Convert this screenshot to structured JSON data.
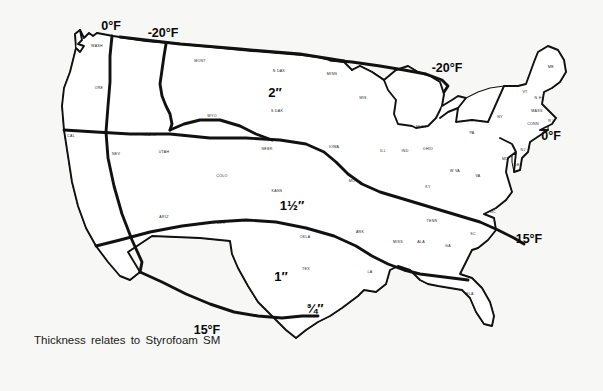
{
  "figure": {
    "caption": "Thickness relates to Styrofoam SM",
    "background_color": "#f7f7f5",
    "line_color": "#111111"
  },
  "temperature_labels": [
    {
      "id": "temp-0f-northwest",
      "text": "0°F",
      "x": 111,
      "y": 30
    },
    {
      "id": "temp-minus20f-west",
      "text": "-20°F",
      "x": 163,
      "y": 37
    },
    {
      "id": "temp-minus20f-lakes",
      "text": "-20°F",
      "x": 447,
      "y": 72
    },
    {
      "id": "temp-0f-northeast",
      "text": "0°F",
      "x": 551,
      "y": 140
    },
    {
      "id": "temp-15f-southeast",
      "text": "15°F",
      "x": 529,
      "y": 243
    },
    {
      "id": "temp-15f-texas",
      "text": "15°F",
      "x": 207,
      "y": 334
    }
  ],
  "thickness_labels": [
    {
      "id": "thickness-2in",
      "text": "2″",
      "x": 275,
      "y": 97,
      "region": "N DAK"
    },
    {
      "id": "thickness-1-5in",
      "text": "1½″",
      "x": 292,
      "y": 210,
      "region": "KANS"
    },
    {
      "id": "thickness-1in",
      "text": "1″",
      "x": 281,
      "y": 281,
      "region": "TEX"
    },
    {
      "id": "thickness-0-75in",
      "text": "¾″",
      "x": 315,
      "y": 313,
      "region": "S TEX"
    }
  ],
  "state_labels": [
    {
      "abbr": "WASH",
      "x": 97,
      "y": 47
    },
    {
      "abbr": "ORE",
      "x": 99,
      "y": 89
    },
    {
      "abbr": "CAL",
      "x": 71,
      "y": 137
    },
    {
      "abbr": "NEV",
      "x": 116,
      "y": 155
    },
    {
      "abbr": "IDAHO",
      "x": 150,
      "y": 136
    },
    {
      "abbr": "UTAH",
      "x": 164,
      "y": 153
    },
    {
      "abbr": "ARIZ",
      "x": 164,
      "y": 218
    },
    {
      "abbr": "MONT",
      "x": 200,
      "y": 62
    },
    {
      "abbr": "WYO",
      "x": 212,
      "y": 117
    },
    {
      "abbr": "COLO",
      "x": 222,
      "y": 177
    },
    {
      "abbr": "N MEX",
      "x": 219,
      "y": 224
    },
    {
      "abbr": "N DAK",
      "x": 279,
      "y": 72
    },
    {
      "abbr": "S DAK",
      "x": 277,
      "y": 112
    },
    {
      "abbr": "NEBR",
      "x": 267,
      "y": 150
    },
    {
      "abbr": "KANS",
      "x": 277,
      "y": 192
    },
    {
      "abbr": "OKLA",
      "x": 305,
      "y": 238
    },
    {
      "abbr": "TEX",
      "x": 306,
      "y": 270
    },
    {
      "abbr": "MINN",
      "x": 332,
      "y": 75
    },
    {
      "abbr": "IOWA",
      "x": 334,
      "y": 148
    },
    {
      "abbr": "MO",
      "x": 352,
      "y": 182
    },
    {
      "abbr": "ARK",
      "x": 360,
      "y": 233
    },
    {
      "abbr": "LA",
      "x": 370,
      "y": 273
    },
    {
      "abbr": "WIS",
      "x": 363,
      "y": 99
    },
    {
      "abbr": "ILL",
      "x": 383,
      "y": 152
    },
    {
      "abbr": "MISS",
      "x": 398,
      "y": 243
    },
    {
      "abbr": "IND",
      "x": 405,
      "y": 152
    },
    {
      "abbr": "MICH",
      "x": 421,
      "y": 128
    },
    {
      "abbr": "OHIO",
      "x": 428,
      "y": 150
    },
    {
      "abbr": "KY",
      "x": 428,
      "y": 188
    },
    {
      "abbr": "ALA",
      "x": 421,
      "y": 243
    },
    {
      "abbr": "TENN",
      "x": 432,
      "y": 222
    },
    {
      "abbr": "GA",
      "x": 448,
      "y": 247
    },
    {
      "abbr": "FLA",
      "x": 470,
      "y": 295
    },
    {
      "abbr": "W VA",
      "x": 455,
      "y": 172
    },
    {
      "abbr": "PA",
      "x": 472,
      "y": 134
    },
    {
      "abbr": "VA",
      "x": 478,
      "y": 177
    },
    {
      "abbr": "SC",
      "x": 473,
      "y": 235
    },
    {
      "abbr": "NC",
      "x": 493,
      "y": 213
    },
    {
      "abbr": "NY",
      "x": 500,
      "y": 118
    },
    {
      "abbr": "MD",
      "x": 505,
      "y": 160
    },
    {
      "abbr": "DEL",
      "x": 518,
      "y": 166
    },
    {
      "abbr": "NJ",
      "x": 523,
      "y": 151
    },
    {
      "abbr": "VT",
      "x": 525,
      "y": 93
    },
    {
      "abbr": "N H",
      "x": 538,
      "y": 99
    },
    {
      "abbr": "MASS",
      "x": 537,
      "y": 112
    },
    {
      "abbr": "CONN",
      "x": 533,
      "y": 125
    },
    {
      "abbr": "R I",
      "x": 551,
      "y": 122
    },
    {
      "abbr": "ME",
      "x": 551,
      "y": 68
    }
  ]
}
